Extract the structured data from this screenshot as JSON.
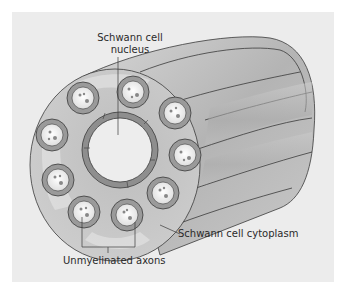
{
  "figure": {
    "type": "cross-section illustration",
    "colors": {
      "background": "#ececec",
      "cytoplasm_face": "#c4c4c4",
      "cylinder_side": "#b3b3b3",
      "axon_sheath": "#9a9a9a",
      "axon_interior": "#f2f2f2",
      "outline": "#3a3a3a"
    }
  },
  "labels": {
    "nucleus_line1": "Schwann cell",
    "nucleus_line2": "nucleus",
    "cytoplasm": "Schwann cell cytoplasm",
    "axons": "Unmyelinated axons"
  },
  "axon_count": 10
}
